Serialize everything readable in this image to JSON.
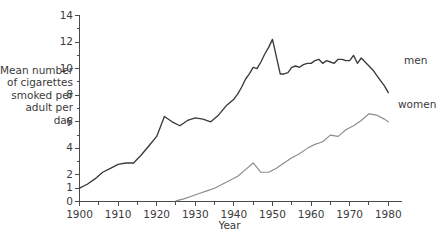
{
  "chart_data": {
    "type": "line",
    "title": "",
    "subtitle": "",
    "xlabel": "Year",
    "ylabel": "Mean number of cigarettes smoked per adult per day",
    "xlim": [
      1900,
      1982
    ],
    "ylim": [
      0,
      14
    ],
    "grid": false,
    "legend_position": "right-inline",
    "xticks": [
      1900,
      1910,
      1920,
      1930,
      1940,
      1950,
      1960,
      1970,
      1980
    ],
    "xticklabels": [
      "1900",
      "1910",
      "1920",
      "1930",
      "1940",
      "1950",
      "1960",
      "1970",
      "1980"
    ],
    "x_minor_ticks": [
      1905,
      1915,
      1925,
      1935,
      1945,
      1955,
      1965,
      1975
    ],
    "yticks": [
      0,
      1,
      2,
      4,
      6,
      8,
      10,
      12,
      14
    ],
    "yticklabels": [
      "0",
      "1",
      "2",
      "4",
      "6",
      "8",
      "10",
      "12",
      "14"
    ],
    "y_minor_ticks": [
      3,
      5,
      7,
      9,
      11,
      13
    ],
    "series": [
      {
        "name": "men",
        "color": "#3a3a3a",
        "x": [
          1900,
          1902,
          1904,
          1906,
          1908,
          1910,
          1912,
          1914,
          1916,
          1918,
          1920,
          1922,
          1924,
          1926,
          1928,
          1930,
          1932,
          1934,
          1936,
          1938,
          1940,
          1941,
          1942,
          1943,
          1944,
          1945,
          1946,
          1947,
          1948,
          1949,
          1950,
          1951,
          1952,
          1953,
          1954,
          1955,
          1956,
          1957,
          1958,
          1959,
          1960,
          1961,
          1962,
          1963,
          1964,
          1965,
          1966,
          1967,
          1968,
          1969,
          1970,
          1971,
          1972,
          1973,
          1974,
          1975,
          1976,
          1977,
          1978,
          1979,
          1980
        ],
        "values": [
          1.0,
          1.3,
          1.7,
          2.2,
          2.5,
          2.8,
          2.9,
          2.9,
          3.5,
          4.2,
          4.9,
          6.4,
          6.0,
          5.7,
          6.1,
          6.3,
          6.2,
          6.0,
          6.5,
          7.2,
          7.7,
          8.1,
          8.6,
          9.2,
          9.6,
          10.1,
          10.0,
          10.5,
          11.1,
          11.6,
          12.2,
          10.9,
          9.6,
          9.6,
          9.7,
          10.1,
          10.2,
          10.1,
          10.3,
          10.4,
          10.4,
          10.6,
          10.7,
          10.4,
          10.6,
          10.5,
          10.4,
          10.7,
          10.7,
          10.6,
          10.6,
          11.0,
          10.4,
          10.8,
          10.5,
          10.2,
          9.9,
          9.5,
          9.1,
          8.7,
          8.2
        ]
      },
      {
        "name": "women",
        "color": "#8c8c8c",
        "x": [
          1925,
          1927,
          1929,
          1931,
          1933,
          1935,
          1937,
          1939,
          1941,
          1943,
          1945,
          1947,
          1949,
          1951,
          1953,
          1955,
          1957,
          1959,
          1961,
          1963,
          1965,
          1967,
          1969,
          1971,
          1973,
          1975,
          1977,
          1979,
          1980
        ],
        "values": [
          0.05,
          0.2,
          0.4,
          0.6,
          0.8,
          1.0,
          1.3,
          1.6,
          1.9,
          2.4,
          2.9,
          2.2,
          2.2,
          2.5,
          2.9,
          3.3,
          3.6,
          4.0,
          4.3,
          4.5,
          5.0,
          4.9,
          5.4,
          5.7,
          6.1,
          6.6,
          6.5,
          6.2,
          6.0
        ]
      }
    ],
    "annotations": [
      {
        "text": "men",
        "series": "men"
      },
      {
        "text": "women",
        "series": "women"
      }
    ]
  },
  "axis": {
    "y_title": "Mean number\nof cigarettes\nsmoked per\nadult per\nday",
    "x_title": "Year"
  },
  "colors": {
    "men_line": "#3a3a3a",
    "women_line": "#8c8c8c",
    "axis": "#4a4a4a",
    "text": "#3b3b3b",
    "background": "#ffffff"
  }
}
